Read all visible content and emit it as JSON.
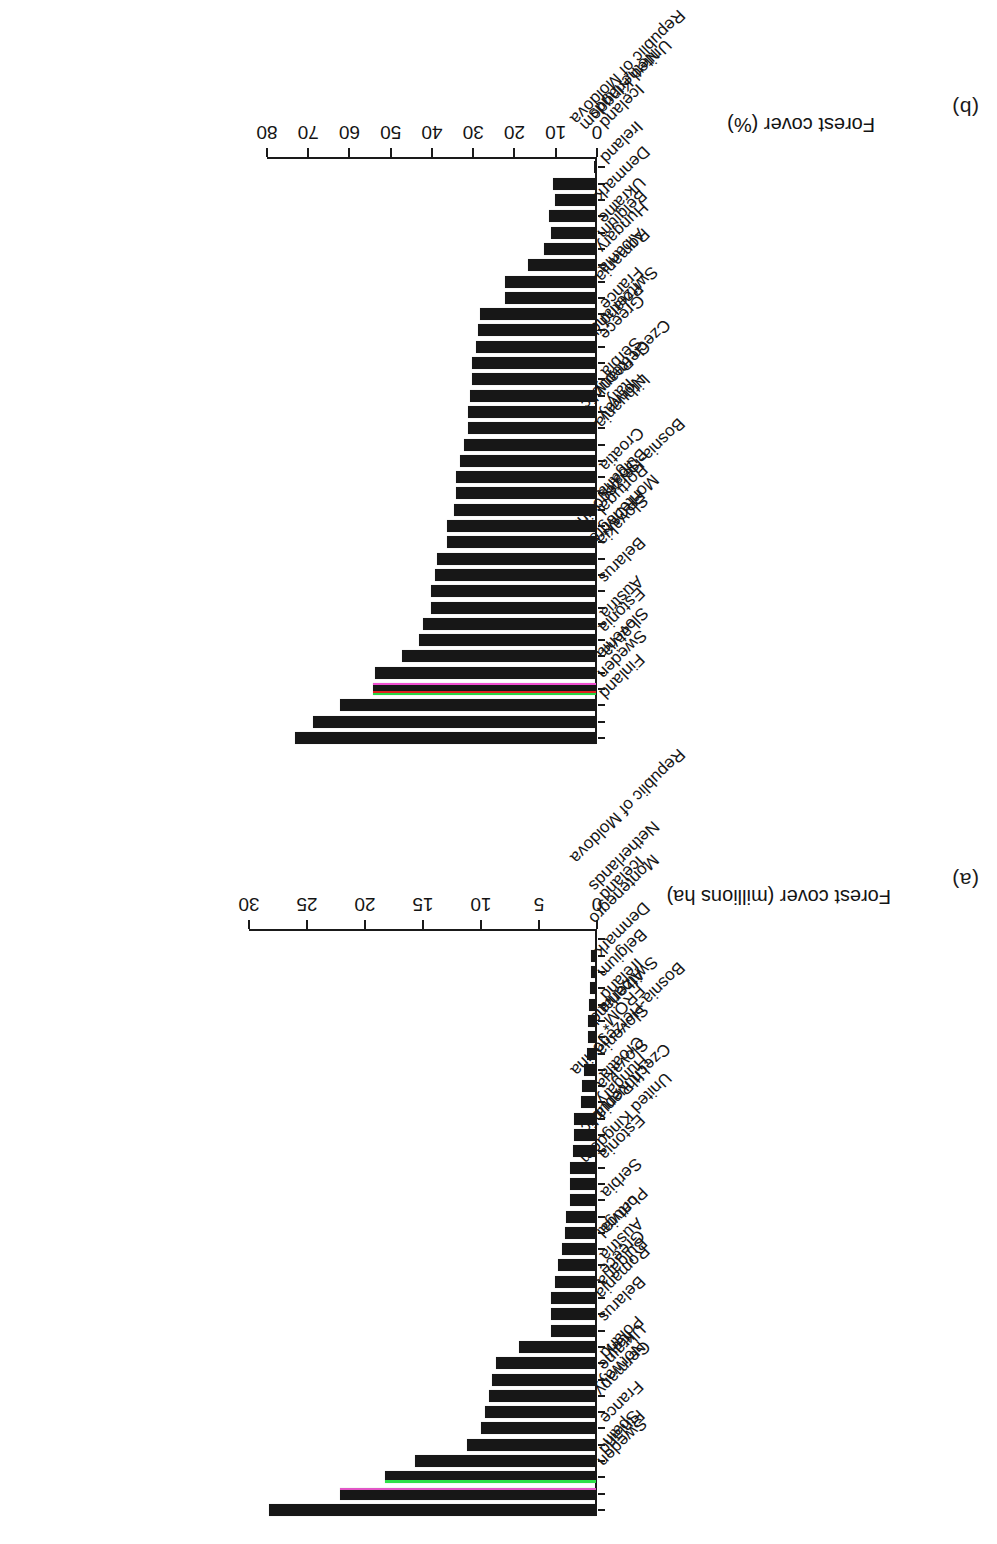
{
  "figure": {
    "note_marker": "*",
    "orientation": "rotated-180"
  },
  "panels": [
    {
      "letter": "(a)",
      "axis_title": "Forest cover (millions ha)",
      "ticks": [
        "0",
        "5",
        "10",
        "15",
        "20",
        "25",
        "30"
      ]
    },
    {
      "letter": "(b)",
      "axis_title": "Forest cover (%)",
      "ticks": [
        "0",
        "10",
        "20",
        "30",
        "40",
        "50",
        "60",
        "70",
        "80"
      ]
    }
  ],
  "chart_data": [
    {
      "type": "bar",
      "panel": "(a)",
      "title": "",
      "xlabel": "",
      "ylabel": "Forest cover (millions ha)",
      "ylim": [
        0,
        30
      ],
      "orientation": "vertical-bars-descending",
      "grid": false,
      "legend": null,
      "categories": [
        "Sweden",
        "Finland",
        "Spain",
        "France",
        "Germany",
        "Norway",
        "Ukraine",
        "Poland",
        "Italy",
        "Belarus",
        "Romania",
        "Bulgaria",
        "Greece",
        "Austria",
        "Portugal",
        "Latvia",
        "United Kingdom",
        "Serbia",
        "Czech Republic",
        "Estonia",
        "Bosnia-Herzegovina",
        "Lithuania",
        "Hungary",
        "Slovakia",
        "Croatia",
        "Slovenia",
        "Switzerland",
        "FROM*",
        "Albania",
        "Ireland",
        "Belgium",
        "Denmark",
        "Montenegro",
        "Republic of Moldova",
        "Netherlands",
        "Iceland"
      ],
      "values": [
        28.2,
        22.1,
        18.2,
        15.6,
        11.1,
        9.9,
        9.6,
        9.2,
        9.0,
        8.6,
        6.6,
        3.9,
        3.9,
        3.9,
        3.5,
        3.3,
        2.9,
        2.7,
        2.6,
        2.2,
        2.2,
        2.2,
        2.0,
        1.9,
        1.9,
        1.3,
        1.2,
        1.0,
        0.8,
        0.7,
        0.7,
        0.6,
        0.5,
        0.4,
        0.4,
        0.05
      ]
    },
    {
      "type": "bar",
      "panel": "(b)",
      "title": "",
      "xlabel": "",
      "ylabel": "Forest cover (%)",
      "ylim": [
        0,
        80
      ],
      "orientation": "vertical-bars-descending",
      "grid": false,
      "legend": null,
      "categories": [
        "Finland",
        "Sweden",
        "Slovenia",
        "Latvia",
        "Estonia",
        "Austria",
        "Bosnia-Herzegovina",
        "Belarus",
        "Montenegro",
        "Slovakia",
        "FROM*",
        "Portugal",
        "Bulgaria",
        "Spain",
        "Croatia",
        "Czech Republic",
        "Lithuania",
        "Norway",
        "Germany",
        "Italy",
        "Serbia",
        "Switzerland",
        "Greece",
        "Poland",
        "France",
        "Romania",
        "Albania",
        "Hungary",
        "Belgium",
        "Ukraine",
        "Denmark",
        "Republic of Moldova",
        "United Kingdom",
        "Ireland",
        "Netherlands",
        "Iceland"
      ],
      "values": [
        73.0,
        68.7,
        62.0,
        54.0,
        53.5,
        47.0,
        43.0,
        42.0,
        40.0,
        40.0,
        39.0,
        38.5,
        36.0,
        36.0,
        34.5,
        34.0,
        34.0,
        33.0,
        32.0,
        31.0,
        31.0,
        30.5,
        30.0,
        30.0,
        29.0,
        28.5,
        28.0,
        22.0,
        22.0,
        16.5,
        12.5,
        11.0,
        11.5,
        10.0,
        10.5,
        0.5
      ]
    }
  ]
}
